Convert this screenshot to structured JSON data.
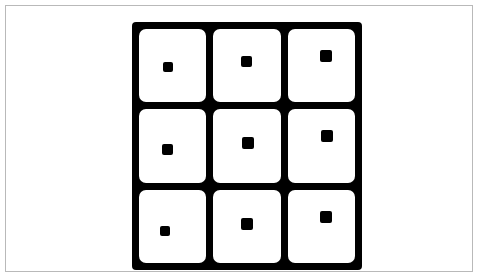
{
  "figure": {
    "type": "grid-matrix-figure",
    "background_color": "#ffffff",
    "border_color": "#b9b9b9",
    "ink_color": "#000000",
    "title": "",
    "caption": ""
  },
  "grid": {
    "rows": 3,
    "columns": 3,
    "line_color": "#000000",
    "cell_fill_color": "#ffffff",
    "line_thickness_px": 7,
    "label": "3 by 3 grid of square cells"
  },
  "cells": [
    {
      "id": "cell-r1-c1",
      "row": 1,
      "column": 1,
      "marker": {
        "shape": "square",
        "color": "#000000",
        "size_px": 10,
        "position": "lower-left-of-center"
      }
    },
    {
      "id": "cell-r1-c2",
      "row": 1,
      "column": 2,
      "marker": {
        "shape": "square",
        "color": "#000000",
        "size_px": 11,
        "position": "center"
      }
    },
    {
      "id": "cell-r1-c3",
      "row": 1,
      "column": 3,
      "marker": {
        "shape": "square",
        "color": "#000000",
        "size_px": 12,
        "position": "upper-right-of-center"
      }
    },
    {
      "id": "cell-r2-c1",
      "row": 2,
      "column": 1,
      "marker": {
        "shape": "square",
        "color": "#000000",
        "size_px": 11,
        "position": "lower-left-of-center"
      }
    },
    {
      "id": "cell-r2-c2",
      "row": 2,
      "column": 2,
      "marker": {
        "shape": "square",
        "color": "#000000",
        "size_px": 12,
        "position": "center"
      }
    },
    {
      "id": "cell-r2-c3",
      "row": 2,
      "column": 3,
      "marker": {
        "shape": "square",
        "color": "#000000",
        "size_px": 12,
        "position": "upper-right-of-center"
      }
    },
    {
      "id": "cell-r3-c1",
      "row": 3,
      "column": 1,
      "marker": {
        "shape": "square",
        "color": "#000000",
        "size_px": 10,
        "position": "lower-left-of-center"
      }
    },
    {
      "id": "cell-r3-c2",
      "row": 3,
      "column": 2,
      "marker": {
        "shape": "square",
        "color": "#000000",
        "size_px": 12,
        "position": "center"
      }
    },
    {
      "id": "cell-r3-c3",
      "row": 3,
      "column": 3,
      "marker": {
        "shape": "square",
        "color": "#000000",
        "size_px": 12,
        "position": "upper-right-of-center"
      }
    }
  ]
}
